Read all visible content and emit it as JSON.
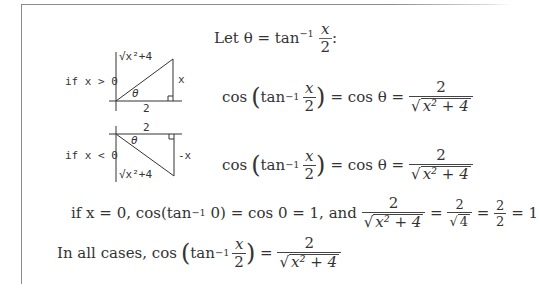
{
  "document": {
    "let_statement": {
      "prefix": "Let θ = tan",
      "sup": "−1",
      "num": "x",
      "den": "2",
      "suffix": ":"
    },
    "case_pos": {
      "condition": "if x > 0",
      "diagram": {
        "hypotenuse": "√x²+4",
        "opposite": "x",
        "adjacent": "2",
        "angle": "θ"
      },
      "equation": {
        "cos": "cos",
        "tan": "tan",
        "sup": "−1",
        "num": "x",
        "den": "2",
        "mid": "= cos θ =",
        "res_num": "2",
        "res_den": "x² + 4"
      }
    },
    "case_neg": {
      "condition": "if x < 0",
      "diagram": {
        "hypotenuse": "√x²+4",
        "opposite": "-x",
        "adjacent": "2",
        "angle": "θ"
      },
      "equation": {
        "cos": "cos",
        "tan": "tan",
        "sup": "−1",
        "num": "x",
        "den": "2",
        "mid": "= cos θ =",
        "res_num": "2",
        "res_den": "x² + 4"
      }
    },
    "case_zero": {
      "text1": "if  x = 0,  cos(tan",
      "sup": "−1",
      "text2": " 0) = cos 0 = 1, and ",
      "f1_num": "2",
      "f1_den": "x² + 4",
      "eq1": " = ",
      "f2_num": "2",
      "f2_den": "4",
      "eq2": " = ",
      "f3_num": "2",
      "f3_den": "2",
      "eq3": " = 1"
    },
    "conclusion": {
      "prefix": "In all cases, cos",
      "tan": "tan",
      "sup": "−1",
      "num": "x",
      "den": "2",
      "eq": " = ",
      "res_num": "2",
      "res_den": "x² + 4"
    }
  }
}
